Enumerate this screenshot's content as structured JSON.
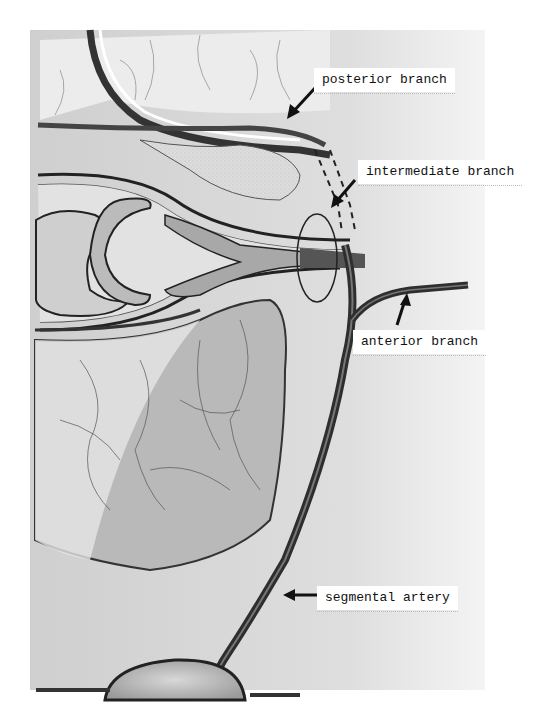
{
  "figure": {
    "labels": [
      {
        "id": "posterior",
        "text": "posterior branch"
      },
      {
        "id": "intermediate",
        "text": "intermediate branch"
      },
      {
        "id": "anterior",
        "text": "anterior branch"
      },
      {
        "id": "segmental",
        "text": "segmental artery"
      }
    ]
  },
  "colors": {
    "background": "#ffffff",
    "shading": "#d6d6d6",
    "vessel": "#3a3a3a",
    "outline": "#1a1a1a",
    "label_bg": "#ffffff"
  }
}
